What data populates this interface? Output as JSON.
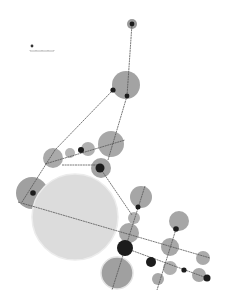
{
  "diagram": {
    "type": "network-graph",
    "background": "#ffffff",
    "colors": {
      "edge": "#555555",
      "node_large_fill": "#dcdcdc",
      "node_large_stroke": "#eeeeee",
      "node_medium_fill": "#a3a3a3",
      "node_small_fill": "#1c1c1c"
    },
    "bubbles": [
      {
        "id": "b-top",
        "cx": 132,
        "cy": 24,
        "r": 5,
        "fill": "#9a9a9a"
      },
      {
        "id": "b-upper",
        "cx": 126,
        "cy": 85,
        "r": 14,
        "fill": "#a3a3a3"
      },
      {
        "id": "b-mid-right",
        "cx": 111,
        "cy": 144,
        "r": 13,
        "fill": "#a8a8a8"
      },
      {
        "id": "b-mid-a",
        "cx": 88,
        "cy": 149,
        "r": 7,
        "fill": "#b0b0b0"
      },
      {
        "id": "b-mid-b",
        "cx": 70,
        "cy": 153,
        "r": 5,
        "fill": "#b5b5b5"
      },
      {
        "id": "b-mid-left",
        "cx": 53,
        "cy": 158,
        "r": 10,
        "fill": "#aaaaaa"
      },
      {
        "id": "b-mid-low",
        "cx": 101,
        "cy": 168,
        "r": 10,
        "fill": "#a3a3a3"
      },
      {
        "id": "b-left",
        "cx": 32,
        "cy": 193,
        "r": 16,
        "fill": "#a0a0a0"
      },
      {
        "id": "b-huge",
        "cx": 75,
        "cy": 217,
        "r": 43,
        "fill": "#dcdcdc",
        "stroke": "#ececec"
      },
      {
        "id": "b-right-a",
        "cx": 141,
        "cy": 197,
        "r": 11,
        "fill": "#a6a6a6"
      },
      {
        "id": "b-right-b",
        "cx": 134,
        "cy": 218,
        "r": 6,
        "fill": "#b0b0b0"
      },
      {
        "id": "b-right-c",
        "cx": 129,
        "cy": 233,
        "r": 10,
        "fill": "#a8a8a8"
      },
      {
        "id": "b-far-right",
        "cx": 179,
        "cy": 221,
        "r": 10,
        "fill": "#a6a6a6"
      },
      {
        "id": "b-right-mid",
        "cx": 170,
        "cy": 247,
        "r": 9,
        "fill": "#a8a8a8"
      },
      {
        "id": "b-edge-right",
        "cx": 203,
        "cy": 258,
        "r": 7,
        "fill": "#aaaaaa"
      },
      {
        "id": "b-bottom-big",
        "cx": 117,
        "cy": 273,
        "r": 16,
        "fill": "#a0a0a0",
        "stroke": "#e4e4e4"
      },
      {
        "id": "b-low-a",
        "cx": 170,
        "cy": 268,
        "r": 7,
        "fill": "#b0b0b0"
      },
      {
        "id": "b-low-b",
        "cx": 158,
        "cy": 279,
        "r": 6,
        "fill": "#a8a8a8"
      },
      {
        "id": "b-low-right",
        "cx": 199,
        "cy": 275,
        "r": 7,
        "fill": "#a8a8a8"
      }
    ],
    "nodes": [
      {
        "id": "n-top",
        "cx": 132,
        "cy": 24,
        "r": 2.4
      },
      {
        "id": "n-upper-a",
        "cx": 113,
        "cy": 90,
        "r": 2.6
      },
      {
        "id": "n-upper-b",
        "cx": 127,
        "cy": 96,
        "r": 2.4
      },
      {
        "id": "n-mid",
        "cx": 81,
        "cy": 150,
        "r": 3
      },
      {
        "id": "n-mid-low",
        "cx": 100,
        "cy": 168,
        "r": 4.5
      },
      {
        "id": "n-left",
        "cx": 33,
        "cy": 193,
        "r": 2.8
      },
      {
        "id": "n-right-a",
        "cx": 138,
        "cy": 207,
        "r": 2.5
      },
      {
        "id": "n-far-right",
        "cx": 176,
        "cy": 229,
        "r": 2.8
      },
      {
        "id": "n-hub",
        "cx": 125,
        "cy": 248,
        "r": 8
      },
      {
        "id": "n-low-a",
        "cx": 151,
        "cy": 262,
        "r": 5
      },
      {
        "id": "n-low-b",
        "cx": 184,
        "cy": 270,
        "r": 2.6
      },
      {
        "id": "n-low-c",
        "cx": 207,
        "cy": 278,
        "r": 3.5
      }
    ],
    "edges": [
      {
        "x1": 132,
        "y1": 24,
        "x2": 127,
        "y2": 96
      },
      {
        "x1": 127,
        "y1": 96,
        "x2": 108,
        "y2": 160
      },
      {
        "x1": 113,
        "y1": 90,
        "x2": 55,
        "y2": 150
      },
      {
        "x1": 55,
        "y1": 150,
        "x2": 22,
        "y2": 202
      },
      {
        "x1": 45,
        "y1": 164,
        "x2": 125,
        "y2": 140
      },
      {
        "x1": 62,
        "y1": 165,
        "x2": 100,
        "y2": 165
      },
      {
        "x1": 100,
        "y1": 168,
        "x2": 132,
        "y2": 215
      },
      {
        "x1": 18,
        "y1": 202,
        "x2": 210,
        "y2": 258
      },
      {
        "x1": 145,
        "y1": 186,
        "x2": 112,
        "y2": 290
      },
      {
        "x1": 125,
        "y1": 248,
        "x2": 207,
        "y2": 278
      },
      {
        "x1": 176,
        "y1": 229,
        "x2": 157,
        "y2": 290
      }
    ],
    "legend": {
      "marker_cx": 32,
      "marker_cy": 46,
      "marker_r": 1.4,
      "scale_y": 51,
      "scale_x1": 30,
      "scale_x2": 54
    }
  }
}
